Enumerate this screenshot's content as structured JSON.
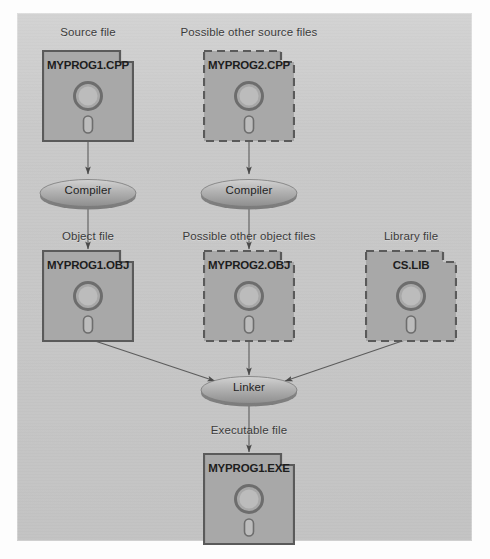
{
  "figure": {
    "panel_color": "#c9c9c9",
    "disk_fill": "#a8a8a8",
    "disk_stroke": "#5a5a5a",
    "arrow_color": "#4a4a4a"
  },
  "captions": {
    "source_file": "Source file",
    "possible_other_source_files": "Possible other source files",
    "object_file": "Object  file",
    "possible_other_object_files": "Possible other object files",
    "library_file": "Library file",
    "executable_file": "Executable  file"
  },
  "disks": [
    {
      "id": "myprog1-cpp",
      "label": "MYPROG1.CPP",
      "border": "solid",
      "kind": "source"
    },
    {
      "id": "myprog2-cpp",
      "label": "MYPROG2.CPP",
      "border": "dashed",
      "kind": "source"
    },
    {
      "id": "myprog1-obj",
      "label": "MYPROG1.OBJ",
      "border": "solid",
      "kind": "object"
    },
    {
      "id": "myprog2-obj",
      "label": "MYPROG2.OBJ",
      "border": "dashed",
      "kind": "object"
    },
    {
      "id": "cs-lib",
      "label": "CS.LIB",
      "border": "dashed",
      "kind": "library"
    },
    {
      "id": "myprog1-exe",
      "label": "MYPROG1.EXE",
      "border": "solid",
      "kind": "executable"
    }
  ],
  "processes": [
    {
      "id": "compiler-left",
      "label": "Compiler"
    },
    {
      "id": "compiler-right",
      "label": "Compiler"
    },
    {
      "id": "linker",
      "label": "Linker"
    }
  ]
}
